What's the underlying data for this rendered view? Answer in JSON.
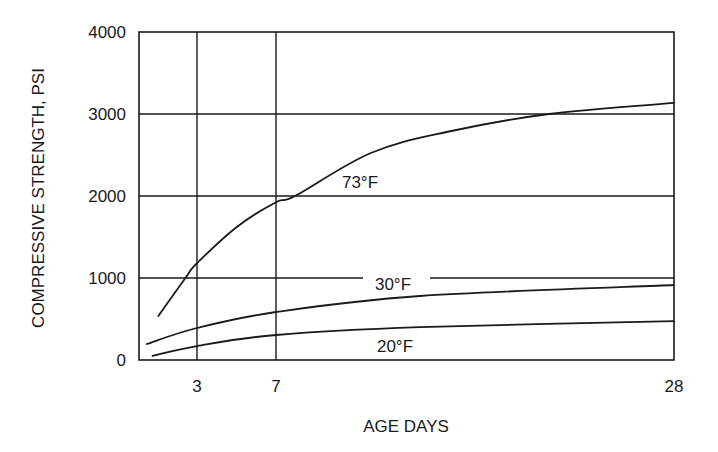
{
  "chart_data": {
    "type": "line",
    "title": "",
    "xlabel": "AGE DAYS",
    "ylabel": "COMPRESSIVE STRENGTH, PSI",
    "xlim": [
      0,
      28
    ],
    "ylim": [
      0,
      4000
    ],
    "x_ticks": [
      3,
      7,
      28
    ],
    "x_tick_labels": [
      "3",
      "7",
      "28"
    ],
    "y_ticks": [
      0,
      1000,
      2000,
      3000,
      4000
    ],
    "y_tick_labels": [
      "0",
      "1000",
      "2000",
      "3000",
      "4000"
    ],
    "grid": true,
    "legend": "none (curves labeled inline)",
    "series": [
      {
        "name": "73°F",
        "label": "73°F",
        "x": [
          1.0,
          2.4,
          3,
          5,
          7,
          8,
          12,
          16,
          21.4,
          28
        ],
        "values": [
          535,
          1000,
          1180,
          1620,
          1925,
          2000,
          2525,
          2780,
          3000,
          3135
        ]
      },
      {
        "name": "30°F",
        "label": "30°F",
        "x": [
          0.4,
          3,
          7,
          14.6,
          28
        ],
        "values": [
          195,
          390,
          585,
          780,
          915
        ]
      },
      {
        "name": "20°F",
        "label": "20°F",
        "x": [
          0.7,
          3,
          7,
          14.6,
          28
        ],
        "values": [
          50,
          170,
          305,
          400,
          475
        ]
      }
    ]
  },
  "annotations": [
    {
      "text": "73°F",
      "series": "73°F"
    },
    {
      "text": "30°F",
      "series": "30°F"
    },
    {
      "text": "20°F",
      "series": "20°F"
    }
  ]
}
